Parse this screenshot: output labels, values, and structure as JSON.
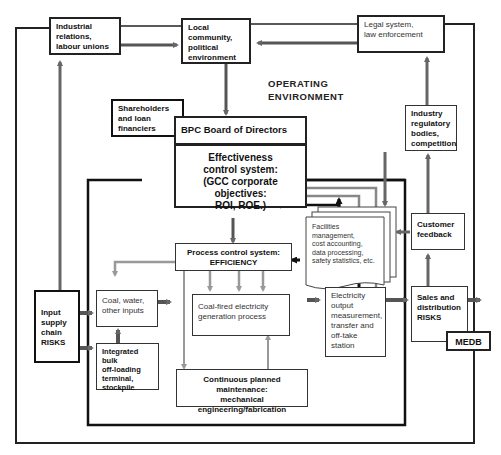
{
  "environment_label": [
    "OPERATING",
    "ENVIRONMENT"
  ],
  "nodes": {
    "industrial_relations": {
      "lines": [
        "Industrial",
        "relations,",
        "labour unions"
      ]
    },
    "local_community": {
      "lines": [
        "Local",
        "community,",
        "political",
        "environment"
      ]
    },
    "legal_system": {
      "lines": [
        "Legal system,",
        "law enforcement"
      ]
    },
    "shareholders": {
      "lines": [
        "Shareholders",
        "and loan",
        "financiers"
      ]
    },
    "board": {
      "lines": [
        "BPC Board of Directors"
      ]
    },
    "effectiveness": {
      "lines": [
        "Effectiveness",
        "control system:",
        "(GCC corporate objectives:",
        "ROI, ROE.)"
      ]
    },
    "industry_regulatory": {
      "lines": [
        "Industry",
        "regulatory",
        "bodies,",
        "competition"
      ]
    },
    "customer_feedback": {
      "lines": [
        "Customer",
        "feedback"
      ]
    },
    "facilities_docs": {
      "lines": [
        "Facilities",
        "management,",
        "cost accounting,",
        "data processing,",
        "safety statistics, etc."
      ]
    },
    "process_control": {
      "lines": [
        "Process control system:",
        "EFFICIENCY"
      ]
    },
    "coal_inputs": {
      "lines": [
        "Coal, water,",
        "other inputs"
      ]
    },
    "coal_fired": {
      "lines": [
        "Coal-fired electricity",
        "generation process"
      ]
    },
    "electricity_output": {
      "lines": [
        "Electricity",
        "output",
        "measurement,",
        "transfer and",
        "off-take",
        "station"
      ]
    },
    "input_supply": {
      "lines": [
        "Input",
        "supply",
        "chain",
        "RISKS"
      ]
    },
    "integrated_bulk": {
      "lines": [
        "Integrated bulk",
        "off-loading",
        "terminal,",
        "stockpile"
      ]
    },
    "sales_distribution": {
      "lines": [
        "Sales and",
        "distribution",
        "RISKS"
      ]
    },
    "medb": {
      "lines": [
        "MEDB"
      ]
    },
    "maintenance": {
      "lines": [
        "Continuous planned maintenance:",
        "mechanical",
        "engineering/fabrication"
      ]
    }
  },
  "colors": {
    "dark_line": "#222222",
    "grey_arrow": "#777777",
    "light_grey_arrow": "#999999"
  }
}
